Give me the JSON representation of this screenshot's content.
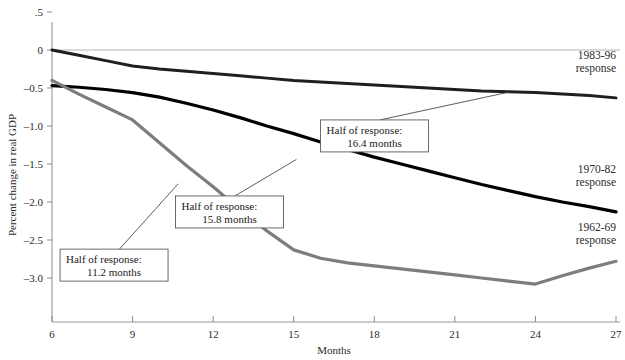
{
  "chart_data": {
    "type": "line",
    "title": "",
    "xlabel": "Months",
    "ylabel": "Percent change in real GDP",
    "xlim": [
      6,
      27
    ],
    "ylim": [
      -3.3,
      0.5
    ],
    "grid": false,
    "legend_position": "inline-right",
    "xticks": [
      "6",
      "9",
      "12",
      "15",
      "18",
      "21",
      "24",
      "27"
    ],
    "xtick_values": [
      6,
      9,
      12,
      15,
      18,
      21,
      24,
      27
    ],
    "yticks": [
      ".5",
      "0",
      "–0.5",
      "–1.0",
      "–1.5",
      "–2.0",
      "–2.5",
      "–3.0"
    ],
    "ytick_values": [
      0.5,
      0,
      -0.5,
      -1.0,
      -1.5,
      -2.0,
      -2.5,
      -3.0
    ],
    "zero_line": 0,
    "x": [
      6,
      7,
      8,
      9,
      10,
      11,
      12,
      13,
      14,
      15,
      16,
      17,
      18,
      19,
      20,
      21,
      22,
      23,
      24,
      25,
      26,
      27
    ],
    "series": [
      {
        "name": "1983-96 response",
        "color": "#1f1f1f",
        "width": 3.0,
        "values": [
          0.0,
          -0.07,
          -0.14,
          -0.21,
          -0.25,
          -0.28,
          -0.31,
          -0.34,
          -0.37,
          -0.4,
          -0.42,
          -0.44,
          -0.46,
          -0.48,
          -0.5,
          -0.52,
          -0.54,
          -0.55,
          -0.56,
          -0.58,
          -0.6,
          -0.63
        ]
      },
      {
        "name": "1970-82 response",
        "color": "#000000",
        "width": 3.2,
        "values": [
          -0.47,
          -0.49,
          -0.52,
          -0.56,
          -0.62,
          -0.7,
          -0.79,
          -0.89,
          -1.0,
          -1.1,
          -1.21,
          -1.31,
          -1.41,
          -1.5,
          -1.59,
          -1.68,
          -1.77,
          -1.85,
          -1.93,
          -2.0,
          -2.06,
          -2.13
        ]
      },
      {
        "name": "1962-69 response",
        "color": "#7d7d7d",
        "width": 3.2,
        "values": [
          -0.4,
          -0.58,
          -0.75,
          -0.92,
          -1.22,
          -1.52,
          -1.8,
          -2.1,
          -2.38,
          -2.63,
          -2.74,
          -2.8,
          -2.84,
          -2.88,
          -2.92,
          -2.96,
          -3.0,
          -3.04,
          -3.08,
          -2.97,
          -2.87,
          -2.78
        ]
      }
    ],
    "series_labels": [
      {
        "name": "label-1983-96",
        "line1": "1983-96",
        "line2": "response",
        "x": 27.0,
        "y": -0.12
      },
      {
        "name": "label-1970-82",
        "line1": "1970-82",
        "line2": "response",
        "x": 27.0,
        "y": -1.62
      },
      {
        "name": "label-1962-69",
        "line1": "1962-69",
        "line2": "response",
        "x": 27.0,
        "y": -2.38
      }
    ],
    "annotations": [
      {
        "name": "annotation-1983-96",
        "line1": "Half of response:",
        "line2": "16.4 months",
        "box_x": 16.0,
        "box_y": -0.92,
        "target_x": 23.0,
        "target_y": -0.555
      },
      {
        "name": "annotation-1970-82",
        "line1": "Half of response:",
        "line2": "15.8  months",
        "box_x": 10.6,
        "box_y": -1.92,
        "target_x": 15.1,
        "target_y": -1.44
      },
      {
        "name": "annotation-1962-69",
        "line1": "Half of response:",
        "line2": "11.2 months",
        "box_x": 6.3,
        "box_y": -2.62,
        "target_x": 10.7,
        "target_y": -1.76
      }
    ]
  }
}
